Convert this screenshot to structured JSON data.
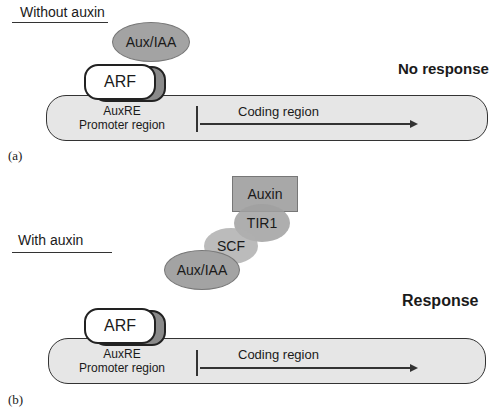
{
  "panel_a": {
    "condition_label": "Without auxin",
    "panel_letter": "(a)",
    "result_label": "No response",
    "proteins": {
      "aux_iaa": "Aux/IAA",
      "arf": "ARF"
    },
    "dna": {
      "element": "AuxRE",
      "promoter": "Promoter region",
      "coding": "Coding region"
    }
  },
  "panel_b": {
    "condition_label": "With auxin",
    "panel_letter": "(b)",
    "result_label": "Response",
    "proteins": {
      "auxin": "Auxin",
      "tir1": "TIR1",
      "scf": "SCF",
      "aux_iaa": "Aux/IAA",
      "arf": "ARF"
    },
    "dna": {
      "element": "AuxRE",
      "promoter": "Promoter region",
      "coding": "Coding region"
    }
  }
}
